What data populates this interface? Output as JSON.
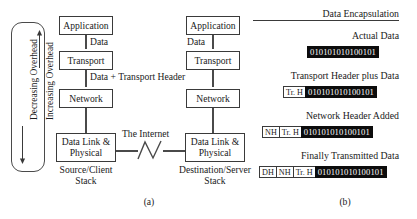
{
  "figure": {
    "panel_a": {
      "label": "(a)",
      "overhead_axis": {
        "top_label": "Increasing Overhead",
        "bottom_label": "Decreasing Overhead",
        "top_arrow": "arrow-up",
        "bottom_arrow": "arrow-down"
      },
      "source_stack": {
        "caption_line1": "Source/Client",
        "caption_line2": "Stack",
        "layers": [
          {
            "name": "Application"
          },
          {
            "name": "Transport"
          },
          {
            "name": "Network"
          },
          {
            "name_line1": "Data Link &",
            "name_line2": "Physical"
          }
        ]
      },
      "destination_stack": {
        "caption_line1": "Destination/Server",
        "caption_line2": "Stack",
        "layers": [
          {
            "name": "Application"
          },
          {
            "name": "Transport"
          },
          {
            "name": "Network"
          },
          {
            "name_line1": "Data Link &",
            "name_line2": "Physical"
          }
        ]
      },
      "edge_labels": {
        "source_app_transport": "Data",
        "source_transport_network": "Data + Transport Header",
        "dest_app_transport": "Data",
        "internet": "The Internet"
      }
    },
    "panel_b": {
      "label": "(b)",
      "title": "Data Encapsulation",
      "rows": [
        {
          "caption": "Actual Data",
          "headers": [],
          "payload": "010101010100101"
        },
        {
          "caption": "Transport Header plus Data",
          "headers": [
            "Tr. H"
          ],
          "payload": "010101010100101"
        },
        {
          "caption": "Network Header Added",
          "headers": [
            "NH",
            "Tr. H"
          ],
          "payload": "010101010100101"
        },
        {
          "caption": "Finally Transmitted Data",
          "headers": [
            "DH",
            "NH",
            "Tr. H"
          ],
          "payload": "010101010100101"
        }
      ]
    }
  },
  "colors": {
    "background": "#ffffff",
    "ink": "#1a1a1a",
    "stroke": "#3a3a3a",
    "connector": "#4a4a4a",
    "payload_bg": "#0c0c0c",
    "payload_fg": "#ffffff"
  }
}
